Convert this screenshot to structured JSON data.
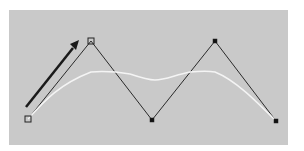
{
  "figure": {
    "width": 304,
    "height": 151,
    "background": "#ffffff",
    "panel": {
      "x": 9,
      "y": 10,
      "width": 279,
      "height": 135,
      "fill": "#c9c9c9"
    },
    "control_polygon": {
      "stroke": "#2a2a2a",
      "stroke_width": 1,
      "points": [
        {
          "x": 28,
          "y": 119,
          "marker": "hollow-square"
        },
        {
          "x": 91,
          "y": 41,
          "marker": "hollow-square"
        },
        {
          "x": 152,
          "y": 120,
          "marker": "filled-square"
        },
        {
          "x": 215,
          "y": 41,
          "marker": "filled-square"
        },
        {
          "x": 276,
          "y": 121,
          "marker": "filled-square"
        }
      ]
    },
    "curve": {
      "stroke": "#f4f4f4",
      "stroke_width": 1.5,
      "path": "M28,119 C45,100 60,84 91,72 C105,71 118,72 130,74 C142,78 148,80 155,80 C165,80 175,75 190,72 C200,71 210,71 215,72 C235,80 255,100 276,121"
    },
    "arrow": {
      "stroke": "#1a1a1a",
      "stroke_width": 2.5,
      "from": {
        "x": 26,
        "y": 107
      },
      "to": {
        "x": 79,
        "y": 41
      },
      "head": "70,44 79,40 76,50"
    }
  }
}
